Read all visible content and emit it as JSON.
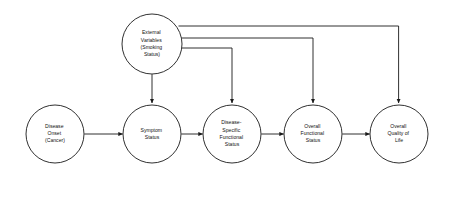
{
  "diagram": {
    "background_color": "#ffffff",
    "stroke_color": "#1a1a1a",
    "text_color": "#111111",
    "nodes": [
      {
        "id": "external-variables",
        "label": "External Variables (Smoking Status)",
        "lines": [
          "External",
          "Variables",
          "(Smoking",
          "Status)"
        ],
        "cx": 152,
        "cy": 44,
        "r": 30
      },
      {
        "id": "disease-onset",
        "label": "Disease Onset (Cancer)",
        "lines": [
          "Disease",
          "Onset",
          "(Cancer)"
        ],
        "cx": 55,
        "cy": 134,
        "r": 29
      },
      {
        "id": "symptom-status",
        "label": "Symptom Status",
        "lines": [
          "Symptom",
          "Status"
        ],
        "cx": 152,
        "cy": 134,
        "r": 29
      },
      {
        "id": "disease-specific-functional-status",
        "label": "Disease-Specific Functional Status",
        "lines": [
          "Disease-",
          "Specific",
          "Functional",
          "Status"
        ],
        "cx": 232,
        "cy": 134,
        "r": 29
      },
      {
        "id": "overall-functional-status",
        "label": "Overall Functional Status",
        "lines": [
          "Overall",
          "Functional",
          "Status"
        ],
        "cx": 313,
        "cy": 134,
        "r": 29
      },
      {
        "id": "overall-quality-of-life",
        "label": "Overall Quality of Life",
        "lines": [
          "Overall",
          "Quality of",
          "Life"
        ],
        "cx": 399,
        "cy": 134,
        "r": 29
      }
    ],
    "edges": [
      {
        "id": "edge-disease-onset-to-symptom-status",
        "from": "disease-onset",
        "to": "symptom-status",
        "kind": "straight-horizontal",
        "arrow": true
      },
      {
        "id": "edge-symptom-status-to-disease-specific",
        "from": "symptom-status",
        "to": "disease-specific-functional-status",
        "kind": "straight-horizontal",
        "arrow": true
      },
      {
        "id": "edge-disease-specific-to-overall-functional",
        "from": "disease-specific-functional-status",
        "to": "overall-functional-status",
        "kind": "straight-horizontal",
        "arrow": true
      },
      {
        "id": "edge-overall-functional-to-quality-of-life",
        "from": "overall-functional-status",
        "to": "overall-quality-of-life",
        "kind": "straight-horizontal",
        "arrow": true
      },
      {
        "id": "edge-external-to-symptom-status",
        "from": "external-variables",
        "to": "symptom-status",
        "kind": "straight-vertical",
        "arrow": true
      },
      {
        "id": "edge-external-to-disease-specific",
        "from": "external-variables",
        "to": "disease-specific-functional-status",
        "kind": "elbow",
        "arrow": true
      },
      {
        "id": "edge-external-to-overall-functional",
        "from": "external-variables",
        "to": "overall-functional-status",
        "kind": "elbow",
        "arrow": true
      },
      {
        "id": "edge-external-to-quality-of-life",
        "from": "external-variables",
        "to": "overall-quality-of-life",
        "kind": "elbow",
        "arrow": true
      }
    ]
  }
}
